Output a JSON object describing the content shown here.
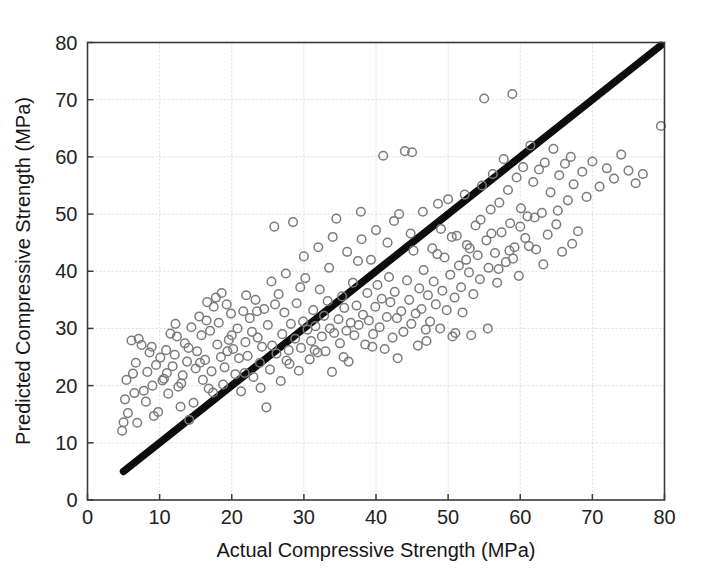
{
  "figure": {
    "background_color": "#ffffff",
    "marker_color": "#7b7b7b",
    "refline_color": "#0d0d0d",
    "grid_color": "#d6d6d6",
    "axis_color": "#3a3a3a"
  },
  "axes": {
    "x_title": "Actual Compressive Strength (MPa)",
    "y_title": "Predicted Compressive Strength (MPa)",
    "x_ticks": [
      0,
      10,
      20,
      30,
      40,
      50,
      60,
      70,
      80
    ],
    "y_ticks": [
      0,
      10,
      20,
      30,
      40,
      50,
      60,
      70,
      80
    ],
    "x_tick_labels": [
      "0",
      "10",
      "20",
      "30",
      "40",
      "50",
      "60",
      "70",
      "80"
    ],
    "y_tick_labels": [
      "0",
      "10",
      "20",
      "30",
      "40",
      "50",
      "60",
      "70",
      "80"
    ]
  },
  "chart_data": {
    "type": "scatter",
    "title": "",
    "xlabel": "Actual Compressive Strength (MPa)",
    "ylabel": "Predicted Compressive Strength (MPa)",
    "xlim": [
      0,
      80
    ],
    "ylim": [
      0,
      80
    ],
    "xticks": [
      0,
      10,
      20,
      30,
      40,
      50,
      60,
      70,
      80
    ],
    "yticks": [
      0,
      10,
      20,
      30,
      40,
      50,
      60,
      70,
      80
    ],
    "grid": true,
    "legend": null,
    "marker": "open-circle",
    "reference_line": {
      "name": "y = x identity line",
      "x": [
        5,
        79.5
      ],
      "y": [
        5,
        79.5
      ],
      "style": "solid",
      "width_px": 7.5,
      "color": "#0d0d0d"
    },
    "series": [
      {
        "name": "Predicted vs Actual",
        "points": [
          [
            4.8,
            12.1
          ],
          [
            5.0,
            13.6
          ],
          [
            5.2,
            17.6
          ],
          [
            5.6,
            15.2
          ],
          [
            6.1,
            27.9
          ],
          [
            6.3,
            22.1
          ],
          [
            6.5,
            18.7
          ],
          [
            6.9,
            13.5
          ],
          [
            7.1,
            28.2
          ],
          [
            7.5,
            27.1
          ],
          [
            7.8,
            19.1
          ],
          [
            8.1,
            17.2
          ],
          [
            8.3,
            22.4
          ],
          [
            8.6,
            25.8
          ],
          [
            8.9,
            26.8
          ],
          [
            9.2,
            14.7
          ],
          [
            9.5,
            23.6
          ],
          [
            9.8,
            15.4
          ],
          [
            10.1,
            24.9
          ],
          [
            10.4,
            20.9
          ],
          [
            10.6,
            21.2
          ],
          [
            10.9,
            26.2
          ],
          [
            11.2,
            18.6
          ],
          [
            11.5,
            29.1
          ],
          [
            11.8,
            23.4
          ],
          [
            12.1,
            25.4
          ],
          [
            12.4,
            28.6
          ],
          [
            12.6,
            19.8
          ],
          [
            12.9,
            16.3
          ],
          [
            13.2,
            21.8
          ],
          [
            13.5,
            27.4
          ],
          [
            13.8,
            24.2
          ],
          [
            14.1,
            14.0
          ],
          [
            14.4,
            30.2
          ],
          [
            14.7,
            17.0
          ],
          [
            15.0,
            23.0
          ],
          [
            15.2,
            26.0
          ],
          [
            15.5,
            32.1
          ],
          [
            15.8,
            28.8
          ],
          [
            16.0,
            21.0
          ],
          [
            16.3,
            24.5
          ],
          [
            16.5,
            31.4
          ],
          [
            16.8,
            19.5
          ],
          [
            17.0,
            29.6
          ],
          [
            17.2,
            22.5
          ],
          [
            17.5,
            33.8
          ],
          [
            17.8,
            35.4
          ],
          [
            18.0,
            27.2
          ],
          [
            18.2,
            31.0
          ],
          [
            18.5,
            25.0
          ],
          [
            18.8,
            20.2
          ],
          [
            19.0,
            23.2
          ],
          [
            19.3,
            34.2
          ],
          [
            19.6,
            28.0
          ],
          [
            19.9,
            32.6
          ],
          [
            20.2,
            26.4
          ],
          [
            20.5,
            22.0
          ],
          [
            20.8,
            30.0
          ],
          [
            21.0,
            24.8
          ],
          [
            21.3,
            19.0
          ],
          [
            21.6,
            33.0
          ],
          [
            21.9,
            27.6
          ],
          [
            22.2,
            25.2
          ],
          [
            22.5,
            31.8
          ],
          [
            22.8,
            29.4
          ],
          [
            23.0,
            21.5
          ],
          [
            23.3,
            35.0
          ],
          [
            23.6,
            28.4
          ],
          [
            23.9,
            24.0
          ],
          [
            24.2,
            26.8
          ],
          [
            24.5,
            33.4
          ],
          [
            24.8,
            16.2
          ],
          [
            25.0,
            30.6
          ],
          [
            25.3,
            22.8
          ],
          [
            25.6,
            27.0
          ],
          [
            25.9,
            47.8
          ],
          [
            26.2,
            25.6
          ],
          [
            26.5,
            36.0
          ],
          [
            26.8,
            20.8
          ],
          [
            27.0,
            29.0
          ],
          [
            27.3,
            32.8
          ],
          [
            27.6,
            24.4
          ],
          [
            27.9,
            26.2
          ],
          [
            28.2,
            30.8
          ],
          [
            28.5,
            48.6
          ],
          [
            28.8,
            28.2
          ],
          [
            29.0,
            34.4
          ],
          [
            29.3,
            22.6
          ],
          [
            29.6,
            26.6
          ],
          [
            29.9,
            31.2
          ],
          [
            30.2,
            38.8
          ],
          [
            30.5,
            29.8
          ],
          [
            30.8,
            24.6
          ],
          [
            31.0,
            27.8
          ],
          [
            31.3,
            33.2
          ],
          [
            31.6,
            30.4
          ],
          [
            31.9,
            25.8
          ],
          [
            32.2,
            36.8
          ],
          [
            32.5,
            28.6
          ],
          [
            32.8,
            32.2
          ],
          [
            33.0,
            26.0
          ],
          [
            33.3,
            34.8
          ],
          [
            33.6,
            30.0
          ],
          [
            33.9,
            22.4
          ],
          [
            34.2,
            29.2
          ],
          [
            34.5,
            49.2
          ],
          [
            34.8,
            31.6
          ],
          [
            35.0,
            27.4
          ],
          [
            35.3,
            35.6
          ],
          [
            35.6,
            33.6
          ],
          [
            35.9,
            29.6
          ],
          [
            36.2,
            24.2
          ],
          [
            36.5,
            31.0
          ],
          [
            36.8,
            38.0
          ],
          [
            37.0,
            28.8
          ],
          [
            37.3,
            34.0
          ],
          [
            37.6,
            30.6
          ],
          [
            37.9,
            50.4
          ],
          [
            38.2,
            32.4
          ],
          [
            38.5,
            27.2
          ],
          [
            38.8,
            36.2
          ],
          [
            39.0,
            31.4
          ],
          [
            39.3,
            42.0
          ],
          [
            39.6,
            29.0
          ],
          [
            39.9,
            33.8
          ],
          [
            40.2,
            37.6
          ],
          [
            40.5,
            30.2
          ],
          [
            40.8,
            35.2
          ],
          [
            41.0,
            60.2
          ],
          [
            41.2,
            26.4
          ],
          [
            41.5,
            32.0
          ],
          [
            41.8,
            39.0
          ],
          [
            42.0,
            34.6
          ],
          [
            42.3,
            28.4
          ],
          [
            42.6,
            36.4
          ],
          [
            42.9,
            31.8
          ],
          [
            43.2,
            50.0
          ],
          [
            43.5,
            33.0
          ],
          [
            43.8,
            29.4
          ],
          [
            44.0,
            61.0
          ],
          [
            44.3,
            38.4
          ],
          [
            44.6,
            35.0
          ],
          [
            44.9,
            30.8
          ],
          [
            45.2,
            43.6
          ],
          [
            45.5,
            32.6
          ],
          [
            45.8,
            27.0
          ],
          [
            46.0,
            37.0
          ],
          [
            46.3,
            33.4
          ],
          [
            46.6,
            40.2
          ],
          [
            46.9,
            29.8
          ],
          [
            47.2,
            35.8
          ],
          [
            47.5,
            31.2
          ],
          [
            47.8,
            44.0
          ],
          [
            48.0,
            38.2
          ],
          [
            48.3,
            34.2
          ],
          [
            48.6,
            51.8
          ],
          [
            48.9,
            30.0
          ],
          [
            49.2,
            36.6
          ],
          [
            49.5,
            42.4
          ],
          [
            49.8,
            33.2
          ],
          [
            50.0,
            52.6
          ],
          [
            50.3,
            39.4
          ],
          [
            50.6,
            28.6
          ],
          [
            50.9,
            35.4
          ],
          [
            51.2,
            46.2
          ],
          [
            51.5,
            41.0
          ],
          [
            51.8,
            37.2
          ],
          [
            52.0,
            32.8
          ],
          [
            52.3,
            53.4
          ],
          [
            52.6,
            44.6
          ],
          [
            52.9,
            39.8
          ],
          [
            53.2,
            28.8
          ],
          [
            53.5,
            36.0
          ],
          [
            53.8,
            48.0
          ],
          [
            54.1,
            42.8
          ],
          [
            54.4,
            38.6
          ],
          [
            54.7,
            55.0
          ],
          [
            55.0,
            70.2
          ],
          [
            55.3,
            45.4
          ],
          [
            55.6,
            40.6
          ],
          [
            55.9,
            50.8
          ],
          [
            56.2,
            57.0
          ],
          [
            56.5,
            43.2
          ],
          [
            56.8,
            38.0
          ],
          [
            57.1,
            52.0
          ],
          [
            57.4,
            46.8
          ],
          [
            57.7,
            59.6
          ],
          [
            58.0,
            41.6
          ],
          [
            58.3,
            54.2
          ],
          [
            58.6,
            48.4
          ],
          [
            58.9,
            71.0
          ],
          [
            59.2,
            44.2
          ],
          [
            59.5,
            56.4
          ],
          [
            59.8,
            39.2
          ],
          [
            60.1,
            51.0
          ],
          [
            60.4,
            58.2
          ],
          [
            60.7,
            45.8
          ],
          [
            61.0,
            49.6
          ],
          [
            61.4,
            62.0
          ],
          [
            61.8,
            55.6
          ],
          [
            62.2,
            43.8
          ],
          [
            62.6,
            57.8
          ],
          [
            63.0,
            50.2
          ],
          [
            63.4,
            59.0
          ],
          [
            63.8,
            46.4
          ],
          [
            64.2,
            53.8
          ],
          [
            64.6,
            61.4
          ],
          [
            65.0,
            48.2
          ],
          [
            65.4,
            56.8
          ],
          [
            65.8,
            43.4
          ],
          [
            66.2,
            58.8
          ],
          [
            66.6,
            52.4
          ],
          [
            67.0,
            60.0
          ],
          [
            67.4,
            55.2
          ],
          [
            68.0,
            47.0
          ],
          [
            68.6,
            57.4
          ],
          [
            69.2,
            53.0
          ],
          [
            70.0,
            59.2
          ],
          [
            71.0,
            54.8
          ],
          [
            72.0,
            58.0
          ],
          [
            73.0,
            56.2
          ],
          [
            74.0,
            60.4
          ],
          [
            75.0,
            57.6
          ],
          [
            76.0,
            55.4
          ],
          [
            77.0,
            57.0
          ],
          [
            79.5,
            65.4
          ],
          [
            5.4,
            21.0
          ],
          [
            6.7,
            24.0
          ],
          [
            9.0,
            20.0
          ],
          [
            11.0,
            22.2
          ],
          [
            13.0,
            20.4
          ],
          [
            14.0,
            26.6
          ],
          [
            15.6,
            24.0
          ],
          [
            17.4,
            18.8
          ],
          [
            19.4,
            26.0
          ],
          [
            20.0,
            28.8
          ],
          [
            21.8,
            22.2
          ],
          [
            23.5,
            33.0
          ],
          [
            24.0,
            19.6
          ],
          [
            26.0,
            34.2
          ],
          [
            28.0,
            23.8
          ],
          [
            29.5,
            37.2
          ],
          [
            31.5,
            26.2
          ],
          [
            33.5,
            40.6
          ],
          [
            35.5,
            25.0
          ],
          [
            37.5,
            41.8
          ],
          [
            39.5,
            26.8
          ],
          [
            41.6,
            45.0
          ],
          [
            43.0,
            24.8
          ],
          [
            44.8,
            46.6
          ],
          [
            47.0,
            27.8
          ],
          [
            49.0,
            47.4
          ],
          [
            51.0,
            29.2
          ],
          [
            53.0,
            44.0
          ],
          [
            55.5,
            30.0
          ],
          [
            57.0,
            40.4
          ],
          [
            59.0,
            42.2
          ],
          [
            61.2,
            44.4
          ],
          [
            63.2,
            41.2
          ],
          [
            65.2,
            50.6
          ],
          [
            67.2,
            44.8
          ],
          [
            12.2,
            30.8
          ],
          [
            16.6,
            34.6
          ],
          [
            18.6,
            36.2
          ],
          [
            22.0,
            35.8
          ],
          [
            25.5,
            38.2
          ],
          [
            27.5,
            39.6
          ],
          [
            30.0,
            42.6
          ],
          [
            32.0,
            44.2
          ],
          [
            34.0,
            46.0
          ],
          [
            36.0,
            43.4
          ],
          [
            38.0,
            45.6
          ],
          [
            40.0,
            47.2
          ],
          [
            42.5,
            48.8
          ],
          [
            45.0,
            60.8
          ],
          [
            46.5,
            50.4
          ],
          [
            48.5,
            43.0
          ],
          [
            50.5,
            46.0
          ],
          [
            52.5,
            42.0
          ],
          [
            54.5,
            49.0
          ],
          [
            56.0,
            46.6
          ],
          [
            58.5,
            43.6
          ],
          [
            60.0,
            47.8
          ],
          [
            62.0,
            49.4
          ]
        ]
      }
    ],
    "n_points": 305
  }
}
